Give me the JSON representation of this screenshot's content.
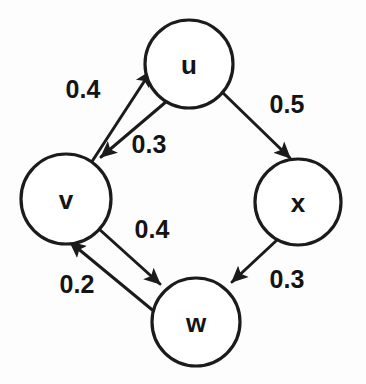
{
  "figure": {
    "kind": "weighted-directed-graph",
    "background_color": "#fdfdfd",
    "stroke_color": "#1b1b1b",
    "text_color": "#141414"
  },
  "nodes": [
    {
      "id": "u",
      "label": "u",
      "cx": 189,
      "cy": 64,
      "r": 44
    },
    {
      "id": "v",
      "label": "v",
      "cx": 66,
      "cy": 199,
      "r": 45
    },
    {
      "id": "x",
      "label": "x",
      "cx": 298,
      "cy": 202,
      "r": 43
    },
    {
      "id": "w",
      "label": "w",
      "cx": 196,
      "cy": 322,
      "r": 44
    }
  ],
  "edges": [
    {
      "id": "v-u",
      "from": "v",
      "to": "u",
      "weight": "0.4",
      "label_x": 83,
      "label_y": 89,
      "x1": 91,
      "y1": 163,
      "x2": 151,
      "y2": 71
    },
    {
      "id": "u-v",
      "from": "u",
      "to": "v",
      "weight": "0.3",
      "label_x": 149,
      "label_y": 144,
      "x1": 167,
      "y1": 101,
      "x2": 101,
      "y2": 157
    },
    {
      "id": "u-x",
      "from": "u",
      "to": "x",
      "weight": "0.5",
      "label_x": 287,
      "label_y": 104,
      "x1": 222,
      "y1": 92,
      "x2": 290,
      "y2": 158
    },
    {
      "id": "v-w",
      "from": "v",
      "to": "w",
      "weight": "0.4",
      "label_x": 152,
      "label_y": 229,
      "x1": 99,
      "y1": 229,
      "x2": 160,
      "y2": 284
    },
    {
      "id": "w-v",
      "from": "w",
      "to": "v",
      "weight": "0.2",
      "label_x": 77,
      "label_y": 284,
      "x1": 156,
      "y1": 313,
      "x2": 70,
      "y2": 242
    },
    {
      "id": "x-w",
      "from": "x",
      "to": "w",
      "weight": "0.3",
      "label_x": 287,
      "label_y": 279,
      "x1": 277,
      "y1": 240,
      "x2": 232,
      "y2": 282
    }
  ]
}
